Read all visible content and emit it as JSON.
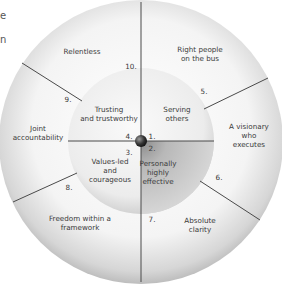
{
  "diagram": {
    "title_fragments": [
      "e",
      "n"
    ],
    "center": {
      "x": 141,
      "y": 141
    },
    "outer_radius": 142,
    "inner_radius": 73,
    "colors": {
      "outer_ring": "#f2f2f2",
      "inner_circle": "#ececec",
      "inner_dark_quadrant": "#c8c8c8",
      "lines": "#4a4a4a",
      "hub": "#3a3a3a",
      "text": "#3a3a3a"
    },
    "inner_segments": [
      {
        "number": "1.",
        "label": "Serving others",
        "lines": [
          "Serving",
          "others"
        ]
      },
      {
        "number": "2.",
        "label": "Personally highly effective",
        "lines": [
          "Personally",
          "highly",
          "effective"
        ]
      },
      {
        "number": "3.",
        "label": "Values-led and courageous",
        "lines": [
          "Values-led",
          "and",
          "courageous"
        ]
      },
      {
        "number": "4.",
        "label": "Trusting and trustworthy",
        "lines": [
          "Trusting",
          "and trustworthy"
        ]
      }
    ],
    "outer_segments": [
      {
        "number": "5.",
        "label": "Right people on the bus",
        "lines": [
          "Right people",
          "on the bus"
        ]
      },
      {
        "number": "6.",
        "label": "A visionary who executes",
        "lines": [
          "A visionary",
          "who",
          "executes"
        ]
      },
      {
        "number": "7.",
        "label": "Absolute clarity",
        "lines": [
          "Absolute",
          "clarity"
        ]
      },
      {
        "number": "8.",
        "label": "Freedom within a framework",
        "lines": [
          "Freedom within a",
          "framework"
        ]
      },
      {
        "number": "9.",
        "label": "Joint accountability",
        "lines": [
          "Joint",
          "accountability"
        ]
      },
      {
        "number": "10.",
        "label": "Relentless",
        "lines": [
          "Relentless"
        ]
      }
    ]
  }
}
